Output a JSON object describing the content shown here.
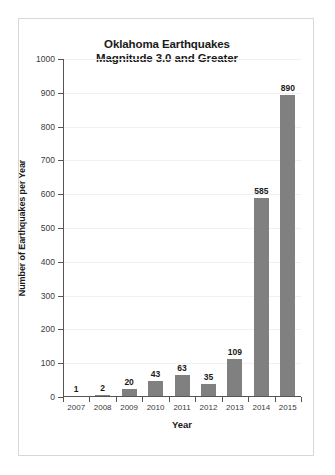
{
  "chart_data": {
    "type": "bar",
    "title": "Oklahoma Earthquakes Magnitude 3.0 and Greater",
    "title_lines": [
      "Oklahoma Earthquakes",
      "Magnitude 3.0 and Greater"
    ],
    "xlabel": "Year",
    "ylabel": "Number of Earthquakes per Year",
    "categories": [
      "2007",
      "2008",
      "2009",
      "2010",
      "2011",
      "2012",
      "2013",
      "2014",
      "2015"
    ],
    "values": [
      1,
      2,
      20,
      43,
      63,
      35,
      109,
      585,
      890
    ],
    "data_labels": [
      "1",
      "2",
      "20",
      "43",
      "63",
      "35",
      "109",
      "585",
      "890"
    ],
    "ylim": [
      0,
      1000
    ],
    "ytick_values": [
      0,
      100,
      200,
      300,
      400,
      500,
      600,
      700,
      800,
      900,
      1000
    ],
    "ytick_labels": [
      "0",
      "100",
      "200",
      "300",
      "400",
      "500",
      "600",
      "700",
      "800",
      "900",
      "1000"
    ],
    "grid": true,
    "legend": false,
    "bar_color": "#808080",
    "axis_color": "#555555",
    "grid_color": "#f0f0f0",
    "text_color": "#1a1a1a",
    "frame_color": "#d8d8d8"
  }
}
